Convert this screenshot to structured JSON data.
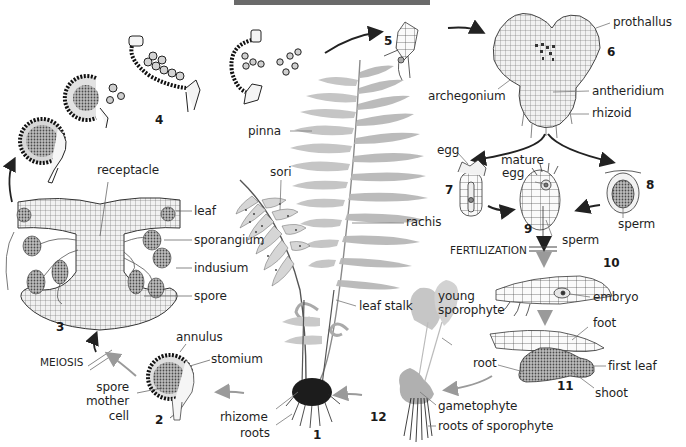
{
  "figure": {
    "title_bar_color": "#6a6a6a",
    "arrow_dark_color": "#222222",
    "arrow_gray_color": "#9a9a9a",
    "ink_color": "#1a1a1a",
    "fern_green_gray": "#b9b9b9"
  },
  "stages": [
    {
      "id": "1",
      "label": "1"
    },
    {
      "id": "2",
      "label": "2"
    },
    {
      "id": "3",
      "label": "3"
    },
    {
      "id": "4",
      "label": "4"
    },
    {
      "id": "5",
      "label": "5"
    },
    {
      "id": "6",
      "label": "6"
    },
    {
      "id": "7",
      "label": "7"
    },
    {
      "id": "8",
      "label": "8"
    },
    {
      "id": "9",
      "label": "9"
    },
    {
      "id": "10",
      "label": "10"
    },
    {
      "id": "11",
      "label": "11"
    },
    {
      "id": "12",
      "label": "12"
    }
  ],
  "labels": {
    "receptacle": "receptacle",
    "leaf": "leaf",
    "sporangium": "sporangium",
    "indusium": "indusium",
    "spore": "spore",
    "meiosis": "MEIOSIS",
    "annulus": "annulus",
    "stomium": "stomium",
    "spore_mother_cell_line1": "spore",
    "spore_mother_cell_line2": "mother",
    "spore_mother_cell_line3": "cell",
    "pinna": "pinna",
    "sori": "sori",
    "rachis": "rachis",
    "leaf_stalk": "leaf stalk",
    "rhizome": "rhizome",
    "roots": "roots",
    "prothallus": "prothallus",
    "archegonium": "archegonium",
    "antheridium": "antheridium",
    "rhizoid": "rhizoid",
    "egg": "egg",
    "mature_egg_line1": "mature",
    "mature_egg_line2": "egg",
    "sperm_9": "sperm",
    "sperm_8": "sperm",
    "fertilization": "FERTILIZATION",
    "embryo": "embryo",
    "foot": "foot",
    "root": "root",
    "first_leaf": "first leaf",
    "shoot": "shoot",
    "young_sporophyte_line1": "young",
    "young_sporophyte_line2": "sporophyte",
    "gametophyte": "gametophyte",
    "roots_of_sporophyte": "roots of sporophyte"
  }
}
